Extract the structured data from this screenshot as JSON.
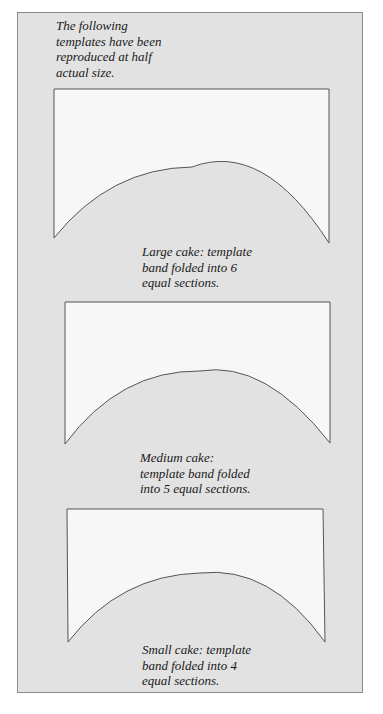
{
  "intro": {
    "lines": [
      "The following",
      "templates have been",
      "reproduced at half",
      "actual size."
    ]
  },
  "templates": [
    {
      "name": "large",
      "caption_lines": [
        "Large cake: template",
        "band folded into 6",
        "equal sections."
      ]
    },
    {
      "name": "medium",
      "caption_lines": [
        "Medium cake:",
        "template band folded",
        "into 5 equal sections."
      ]
    },
    {
      "name": "small",
      "caption_lines": [
        "Small cake: template",
        "band folded into 4",
        "equal sections."
      ]
    }
  ],
  "colors": {
    "panel_bg": "#e2e2e2",
    "template_fill": "#f7f7f7",
    "outline": "#555555"
  }
}
